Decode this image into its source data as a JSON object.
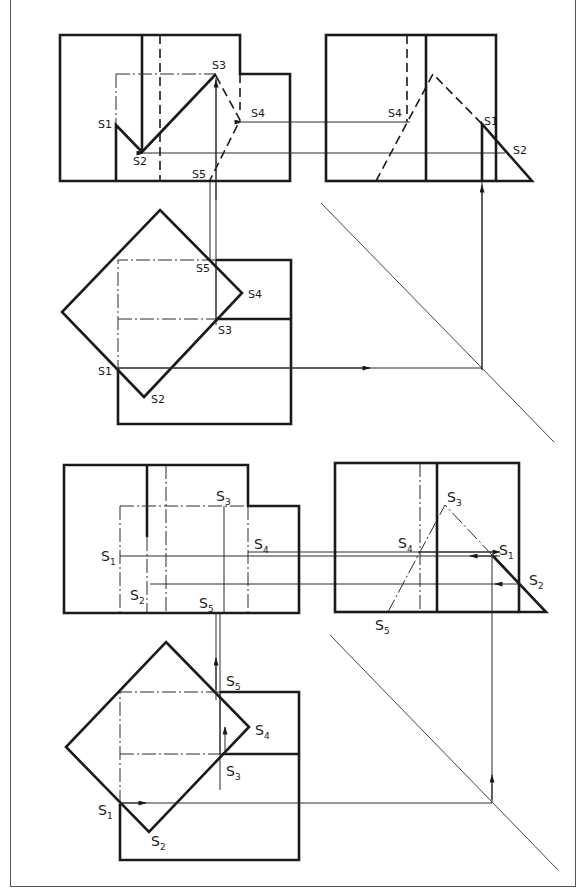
{
  "figure": {
    "panels": [
      {
        "id": "upper",
        "views": [
          "front-view",
          "side-view",
          "top-view"
        ],
        "labels": {
          "front": [
            "S1",
            "S2",
            "S3",
            "S4",
            "S5"
          ],
          "side": [
            "S4",
            "S1",
            "S2"
          ],
          "top": [
            "S5",
            "S4",
            "S3",
            "S1",
            "S2"
          ]
        }
      },
      {
        "id": "lower",
        "views": [
          "front-view",
          "side-view",
          "top-view"
        ],
        "labels": {
          "front": [
            "S1",
            "S2",
            "S3",
            "S4",
            "S5"
          ],
          "side": [
            "S3",
            "S4",
            "S1",
            "S2",
            "S5"
          ],
          "top": [
            "S5",
            "S4",
            "S3",
            "S1",
            "S2"
          ]
        }
      }
    ]
  },
  "labels": {
    "S": "S",
    "n1": "1",
    "n2": "2",
    "n3": "3",
    "n4": "4",
    "n5": "5",
    "S1": "S1",
    "S2": "S2",
    "S3": "S3",
    "S4": "S4",
    "S5": "S5"
  },
  "colors": {
    "line": "#1a1a1a",
    "background": "#ffffff",
    "frame": "#555555"
  }
}
